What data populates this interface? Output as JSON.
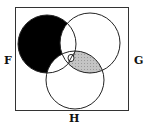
{
  "diagram": {
    "type": "venn-3-set",
    "frame": {
      "x": 15,
      "y": 7,
      "width": 114,
      "height": 104,
      "stroke": "#333333"
    },
    "sets": [
      {
        "name": "F",
        "cx": 47,
        "cy": 44,
        "r": 29
      },
      {
        "name": "G",
        "cx": 90,
        "cy": 43,
        "r": 30
      },
      {
        "name": "H",
        "cx": 75,
        "cy": 80,
        "r": 29
      }
    ],
    "labels": {
      "left": "F",
      "right": "G",
      "bottom": "H"
    },
    "regions": [
      {
        "region": "F only",
        "fill": "#000000"
      },
      {
        "region": "G and H not F",
        "fill": "#b8b8b8",
        "pattern": "hatched"
      },
      {
        "region": "F and G and H",
        "fill": "#ffffff",
        "marker": "empty-set slash"
      }
    ],
    "colors": {
      "stroke": "#222222",
      "shade_black": "#000000",
      "shade_gray": "#b5b5b5",
      "background": "#ffffff"
    }
  }
}
